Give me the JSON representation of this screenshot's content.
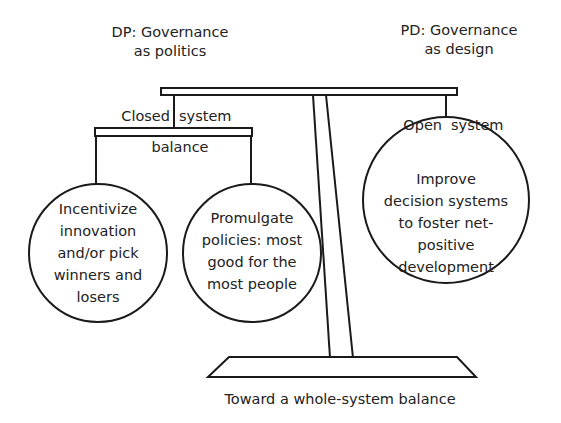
{
  "diagram": {
    "title_left": {
      "line1": "DP: Governance",
      "line2": "as politics"
    },
    "title_right": {
      "line1": "PD: Governance",
      "line2": "as design"
    },
    "closed_system": {
      "left": "Closed",
      "right": "system"
    },
    "open_system": {
      "left": "Open",
      "right": "system"
    },
    "balance_label": "balance",
    "circles": [
      {
        "lines": [
          "Incentivize",
          "innovation",
          "and/or pick",
          "winners and",
          "losers"
        ]
      },
      {
        "lines": [
          "Promulgate",
          "policies: most",
          "good for the",
          "most people"
        ]
      },
      {
        "lines": [
          "Improve",
          "decision systems",
          "to foster net-",
          "positive",
          "development"
        ]
      }
    ],
    "caption": "Toward a whole-system balance",
    "colors": {
      "stroke": "#1a1a1a",
      "text": "#222222",
      "background": "#ffffff"
    }
  }
}
